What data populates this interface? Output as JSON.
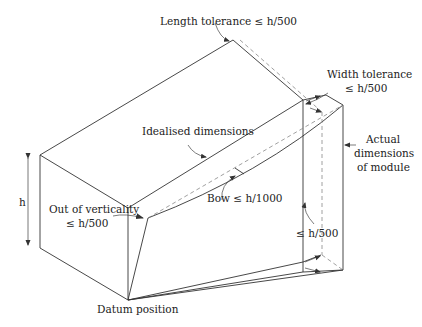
{
  "diagram": {
    "colors": {
      "line": "#333333",
      "dashed": "#888888",
      "text": "#222222",
      "background": "#ffffff"
    },
    "labels": {
      "length_tolerance": "Length tolerance ≤ h/500",
      "width_tolerance_line1": "Width tolerance",
      "width_tolerance_line2": "≤ h/500",
      "idealised_dimensions": "Idealised dimensions",
      "actual_line1": "Actual",
      "actual_line2": "dimensions",
      "actual_line3": "of module",
      "h": "h",
      "out_of_verticality_line1": "Out of verticality",
      "out_of_verticality_line2": "≤ h/500",
      "bow": "Bow ≤ h/1000",
      "base_tolerance": "≤ h/500",
      "datum": "Datum position"
    }
  }
}
